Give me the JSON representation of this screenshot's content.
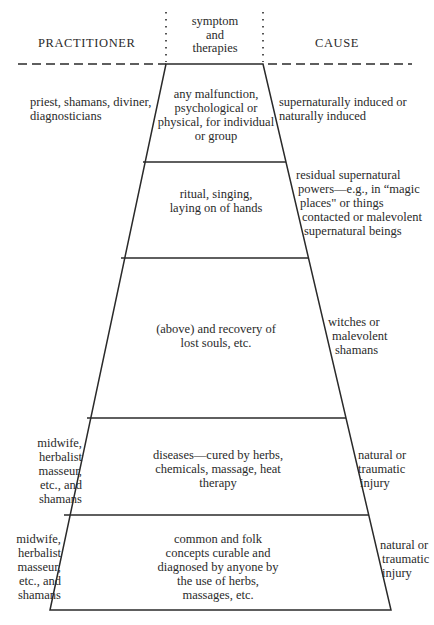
{
  "headers": {
    "practitioner": "PRACTITIONER",
    "symptom_lines": [
      "symptom",
      "and",
      "therapies"
    ],
    "cause": "CAUSE"
  },
  "levels": [
    {
      "practitioner": [
        "priest, shamans, diviner,",
        "diagnosticians"
      ],
      "symptom": [
        "any malfunction,",
        "psychological or",
        "physical, for individual",
        "or group"
      ],
      "cause": [
        "supernaturally induced or",
        "naturally induced"
      ]
    },
    {
      "practitioner": [],
      "symptom": [
        "ritual, singing,",
        "laying on of hands"
      ],
      "cause": [
        "residual supernatural",
        "powers—e.g., in “magic",
        "places\" or things",
        "contacted or malevolent",
        "supernatural beings"
      ]
    },
    {
      "practitioner": [],
      "symptom": [
        "(above) and recovery of",
        "lost souls, etc."
      ],
      "cause": [
        "witches or",
        "malevolent",
        "shamans"
      ]
    },
    {
      "practitioner": [
        "midwife,",
        "herbalist",
        "masseur,",
        "etc., and",
        "shamans"
      ],
      "symptom": [
        "diseases—cured by herbs,",
        "chemicals, massage, heat",
        "therapy"
      ],
      "cause": [
        "natural or",
        "traumatic",
        "injury"
      ]
    },
    {
      "practitioner": [
        "midwife,",
        "herbalist",
        "masseur,",
        "etc., and",
        "shamans"
      ],
      "symptom": [
        "common and folk",
        "concepts curable and",
        "diagnosed by anyone by",
        "the use of herbs,",
        "massages, etc."
      ],
      "cause": [
        "natural or",
        "traumatic",
        "injury"
      ]
    }
  ],
  "geometry": {
    "top_y": 64,
    "bottom_y": 610,
    "top_left_x": 166,
    "top_right_x": 263,
    "bottom_left_x": 50,
    "bottom_right_x": 391,
    "band_boundaries_y": [
      162,
      258,
      418,
      515
    ],
    "dashed_left_x": 18,
    "dashed_right_x": 412,
    "dotted_top_y": 12
  },
  "colors": {
    "ink": "#2a2a2a",
    "background": "#ffffff"
  }
}
